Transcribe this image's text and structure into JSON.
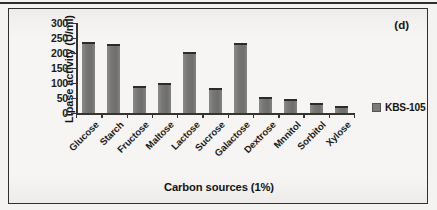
{
  "figure": {
    "panel_tag": "(d)"
  },
  "chart_data": {
    "type": "bar",
    "title": "",
    "xlabel": "Carbon sources (1%)",
    "ylabel": "Lipase activity (U/ml)",
    "categories": [
      "Glucose",
      "Starch",
      "Fructose",
      "Maltose",
      "Lactose",
      "Sucrose",
      "Galactose",
      "Dextrose",
      "Mnnitol",
      "Sorbitol",
      "Xylose"
    ],
    "series": [
      {
        "name": "KBS-105",
        "values": [
          237,
          230,
          90,
          100,
          203,
          85,
          233,
          55,
          46,
          32,
          25
        ]
      }
    ],
    "ylim": [
      0,
      300
    ],
    "yticks": [
      0,
      50,
      100,
      150,
      200,
      250,
      300
    ],
    "ytick_labels": [
      "0",
      "50",
      "100",
      "150",
      "200",
      "250",
      "300"
    ],
    "grid": false,
    "legend_position": "right",
    "bar_color": "#767674",
    "axis_color": "#35342f"
  }
}
